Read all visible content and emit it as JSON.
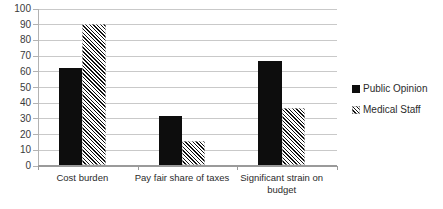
{
  "chart_data": {
    "type": "bar",
    "title": "",
    "subtitle": "",
    "xlabel": "",
    "ylabel": "",
    "categories": [
      "Cost burden",
      "Pay fair share of taxes",
      "Significant strain on budget"
    ],
    "series": [
      {
        "name": "Public Opinion",
        "pattern": "solid",
        "color": "#0d0d0d",
        "values": [
          62,
          31,
          66
        ]
      },
      {
        "name": "Medical Staff",
        "pattern": "diagonal-hatch",
        "color": "#111111",
        "values": [
          90,
          15,
          36
        ]
      }
    ],
    "ylim": [
      0,
      100
    ],
    "ytick_step": 10,
    "yticks": [
      0,
      10,
      20,
      30,
      40,
      50,
      60,
      70,
      80,
      90,
      100
    ],
    "ytick_labels": [
      "0",
      "10",
      "20",
      "30",
      "40",
      "50",
      "60",
      "70",
      "80",
      "90",
      "100"
    ],
    "grid": true,
    "grid_axis": "y",
    "legend_position": "right",
    "legend": [
      "Public Opinion",
      "Medical Staff"
    ],
    "background": "#ffffff"
  }
}
